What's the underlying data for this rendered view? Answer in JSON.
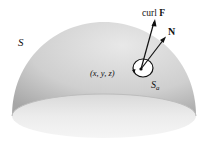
{
  "diagram": {
    "surface_label": "S",
    "point_label": "(x, y, z)",
    "disk_label_main": "S",
    "disk_label_sub": "a",
    "curl_label_prefix": "curl ",
    "curl_label_bold": "F",
    "normal_label": "N"
  },
  "colors": {
    "dome_light": "#e6e6e6",
    "dome_dark": "#a9a9a9",
    "base_light": "#f0f0f0",
    "base_dark": "#c9c9c9",
    "ink": "#111111"
  }
}
